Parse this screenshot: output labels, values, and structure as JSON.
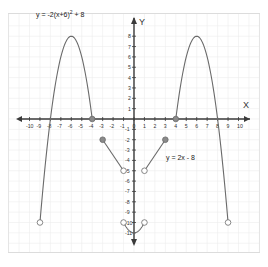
{
  "chart_data": {
    "type": "line",
    "title": "",
    "xlabel": "X",
    "ylabel": "Y",
    "xlim": [
      -10,
      10
    ],
    "ylim": [
      -11,
      8
    ],
    "grid": true,
    "x_ticks": [
      -10,
      -9,
      -8,
      -7,
      -6,
      -5,
      -4,
      -3,
      -2,
      -1,
      0,
      1,
      2,
      3,
      4,
      5,
      6,
      7,
      8,
      9,
      10
    ],
    "y_ticks": [
      8,
      7,
      6,
      5,
      4,
      3,
      2,
      1,
      -1,
      -2,
      -3,
      -4,
      -5,
      -6,
      -7,
      -8,
      -9,
      -10,
      -11
    ],
    "annotations": [
      {
        "text": "y = -2(x+6)² + 8",
        "near": [
          -6,
          9
        ]
      },
      {
        "text": "y = 2x - 8",
        "near": [
          4,
          -3.5
        ]
      }
    ],
    "series": [
      {
        "name": "y = -2(x+6)^2 + 8",
        "kind": "parabola",
        "domain": [
          -9,
          -4
        ],
        "endpoints": [
          {
            "x": -9,
            "y": -10,
            "closed": false
          },
          {
            "x": -4,
            "y": 0,
            "closed": true
          }
        ],
        "vertex": [
          -6,
          8
        ]
      },
      {
        "name": "y = -2(x-6)^2 + 8",
        "kind": "parabola",
        "domain": [
          4,
          9
        ],
        "endpoints": [
          {
            "x": 4,
            "y": 0,
            "closed": true
          },
          {
            "x": 9,
            "y": -10,
            "closed": false
          }
        ],
        "vertex": [
          6,
          8
        ]
      },
      {
        "name": "y = -2x - 8",
        "kind": "segment",
        "endpoints": [
          {
            "x": -3,
            "y": -2,
            "closed": true
          },
          {
            "x": -1,
            "y": -5,
            "closed": false
          }
        ]
      },
      {
        "name": "y = 2x - 8",
        "kind": "segment",
        "endpoints": [
          {
            "x": 3,
            "y": -2,
            "closed": true
          },
          {
            "x": 1,
            "y": -5,
            "closed": false
          }
        ]
      },
      {
        "name": "y = x^2 - 11",
        "kind": "parabola",
        "domain": [
          -1,
          1
        ],
        "endpoints": [
          {
            "x": -1,
            "y": -10,
            "closed": false
          },
          {
            "x": 1,
            "y": -10,
            "closed": false
          }
        ],
        "vertex": [
          0,
          -11
        ]
      }
    ]
  },
  "labels": {
    "x_axis": "X",
    "y_axis": "Y",
    "eq_left": "y = -2(x+6)",
    "eq_left_sup": "2",
    "eq_left_tail": " + 8",
    "eq_right": "y = 2x - 8"
  }
}
